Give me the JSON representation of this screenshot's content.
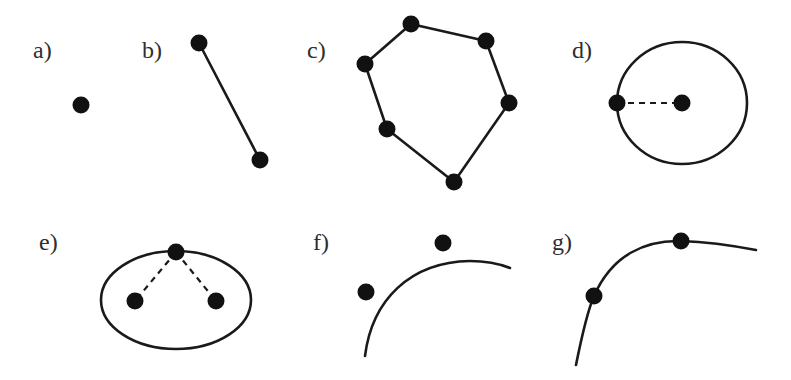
{
  "diagram": {
    "colors": {
      "ink": "#1a1a1a",
      "dot": "#111111",
      "label": "#2e2e2e",
      "background": "#ffffff"
    },
    "panels": [
      {
        "id": "a",
        "label": "a)",
        "label_pos": [
          33,
          38
        ],
        "kind": "point",
        "points": [
          [
            81,
            105
          ]
        ]
      },
      {
        "id": "b",
        "label": "b)",
        "label_pos": [
          142,
          38
        ],
        "kind": "line-segment",
        "points": [
          [
            199,
            43
          ],
          [
            260,
            160
          ]
        ]
      },
      {
        "id": "c",
        "label": "c)",
        "label_pos": [
          307,
          38
        ],
        "kind": "polygon",
        "points": [
          [
            411,
            24
          ],
          [
            486,
            41
          ],
          [
            509,
            103
          ],
          [
            454,
            182
          ],
          [
            387,
            129
          ],
          [
            365,
            64
          ]
        ]
      },
      {
        "id": "d",
        "label": "d)",
        "label_pos": [
          572,
          38
        ],
        "kind": "circle",
        "center": [
          682,
          103
        ],
        "radius_point": [
          617,
          103
        ],
        "rx": 65,
        "ry": 61
      },
      {
        "id": "e",
        "label": "e)",
        "label_pos": [
          39,
          230
        ],
        "kind": "ellipse",
        "center": [
          176,
          300
        ],
        "rx": 75,
        "ry": 49,
        "foci": [
          [
            135,
            301
          ],
          [
            216,
            301
          ]
        ],
        "point_on_curve": [
          176,
          252
        ]
      },
      {
        "id": "f",
        "label": "f)",
        "label_pos": [
          313,
          230
        ],
        "kind": "curve-with-control-points",
        "curve": "M365,356 C372,300 410,262 470,261 C490,261 500,264 510,268",
        "points": [
          [
            443,
            243
          ],
          [
            366,
            292
          ]
        ]
      },
      {
        "id": "g",
        "label": "g)",
        "label_pos": [
          552,
          230
        ],
        "kind": "curve-through-points",
        "curve": "M576,365 C583,330 588,310 594,296 C612,255 645,240 681,241 C710,242 735,246 756,250",
        "points": [
          [
            594,
            296
          ],
          [
            681,
            241
          ]
        ]
      }
    ]
  }
}
